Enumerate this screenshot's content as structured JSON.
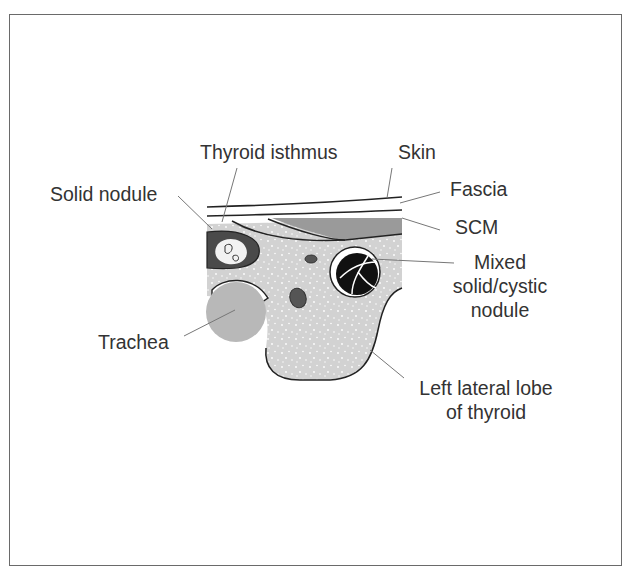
{
  "figure": {
    "title_fragment": "g",
    "labels": {
      "thyroid_isthmus": "Thyroid isthmus",
      "skin": "Skin",
      "solid_nodule": "Solid nodule",
      "fascia": "Fascia",
      "scm": "SCM",
      "mixed_line1": "Mixed",
      "mixed_line2": "solid/cystic",
      "mixed_line3": "nodule",
      "trachea": "Trachea",
      "left_lobe_line1": "Left lateral lobe",
      "left_lobe_line2": "of thyroid"
    },
    "colors": {
      "thyroid_fill": "#d2d2d2",
      "scm_fill": "#9a9a9a",
      "solid_nodule_fill": "#4a4a4a",
      "trachea_fill": "#b8b8b8",
      "cystic_nodule_fill": "#111111",
      "outline": "#222222",
      "leader_line": "#777777",
      "frame": "#6a6a6a"
    }
  }
}
